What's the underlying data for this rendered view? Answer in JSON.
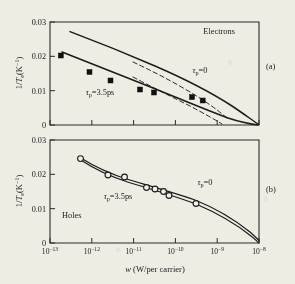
{
  "figure": {
    "background_color": "#efece4",
    "ink_color": "#1a1a1a",
    "xlabel": "w (W/per carrier)",
    "ylabel": "1/Te(K-1)",
    "ylabel_parts": {
      "lead": "1/",
      "t": "T",
      "sub": "e",
      "open": "(K",
      "exp": "−1",
      "close": ")"
    }
  },
  "panel_a": {
    "tag": "(a)",
    "title": "Electrons",
    "annotation_tau0": "τp=0",
    "annotation_tau35": "τp=3.5ps",
    "ytick_labels": [
      "0.03",
      "0.02",
      "0.01",
      "0"
    ]
  },
  "panel_b": {
    "tag": "(b)",
    "title": "Holes",
    "annotation_tau0": "τp=0",
    "annotation_tau35": "τp=3.5ps",
    "ytick_labels": [
      "0.03",
      "0.02",
      "0.01",
      "0"
    ]
  },
  "xaxis": {
    "tick_labels": [
      "10−13",
      "10−12",
      "10−11",
      "10−10",
      "10−9",
      "10−8"
    ],
    "tick_mantissa": "10",
    "tick_exponents": [
      "−13",
      "−12",
      "−11",
      "−10",
      "−9",
      "−8"
    ]
  },
  "chart_data": {
    "type": "line",
    "xlabel": "w (W/per carrier)",
    "ylabel": "1/Te (K^-1)",
    "xscale": "log",
    "xlim": [
      1e-13,
      1e-08
    ],
    "ylim": [
      0,
      0.03
    ],
    "xticks": [
      1e-13,
      1e-12,
      1e-11,
      1e-10,
      1e-09,
      1e-08
    ],
    "yticks": [
      0,
      0.01,
      0.02,
      0.03
    ],
    "grid": false,
    "legend": "inline annotations",
    "panels": [
      {
        "name": "panel_a",
        "tag": "(a)",
        "label": "Electrons",
        "series": [
          {
            "name": "tau_p = 0 (solid, upper)",
            "style": "solid",
            "x": [
              2e-12,
              6e-12,
              2e-11,
              6e-11,
              2e-10,
              6e-10,
              2e-09,
              6e-09,
              1e-08
            ],
            "y": [
              0.0272,
              0.025,
              0.0224,
              0.0202,
              0.0178,
              0.0155,
              0.0125,
              0.007,
              0.002
            ]
          },
          {
            "name": "tau_p = 3.5ps (solid, lower)",
            "style": "solid",
            "x": [
              1e-12,
              4e-12,
              1.5e-11,
              6e-11,
              2e-10,
              6e-10,
              1.5e-09,
              4e-09,
              1e-08
            ],
            "y": [
              0.0212,
              0.0192,
              0.0168,
              0.014,
              0.0118,
              0.0095,
              0.0075,
              0.0048,
              0.0018
            ]
          },
          {
            "name": "tau_p = 0 (dashed)",
            "style": "dashed",
            "x": [
              1.2e-11,
              5e-11,
              2e-10,
              8e-10,
              2.5e-09,
              5e-09
            ],
            "y": [
              0.0205,
              0.0178,
              0.0146,
              0.0112,
              0.0078,
              0.0052
            ]
          },
          {
            "name": "tau_p = 3.5ps (dashed)",
            "style": "dashed",
            "x": [
              1.2e-11,
              5e-11,
              2e-10,
              8e-10,
              2.5e-09,
              5e-09
            ],
            "y": [
              0.0162,
              0.0132,
              0.0104,
              0.0076,
              0.005,
              0.003
            ]
          },
          {
            "name": "experimental data",
            "style": "filled-square",
            "x": [
              1e-12,
              6e-12,
              2e-11,
              1e-10,
              2.2e-10,
              1e-09,
              1.8e-09
            ],
            "y": [
              0.0201,
              0.0153,
              0.0128,
              0.0102,
              0.0093,
              0.008,
              0.007
            ]
          }
        ]
      },
      {
        "name": "panel_b",
        "tag": "(b)",
        "label": "Holes",
        "series": [
          {
            "name": "tau_p = 0 (solid, upper)",
            "style": "solid",
            "x": [
              2.5e-12,
              1e-11,
              5e-11,
              1.5e-10,
              5e-10,
              1.5e-09,
              5e-09,
              1e-08
            ],
            "y": [
              0.0248,
              0.0205,
              0.0178,
              0.0163,
              0.0145,
              0.0125,
              0.008,
              0.0052
            ]
          },
          {
            "name": "tau_p = 3.5ps (solid, lower)",
            "style": "solid",
            "x": [
              2.5e-12,
              1e-11,
              5e-11,
              1.5e-10,
              5e-10,
              1.5e-09,
              5e-09,
              1e-08
            ],
            "y": [
              0.0246,
              0.0199,
              0.0172,
              0.0157,
              0.0138,
              0.0118,
              0.0072,
              0.0045
            ]
          },
          {
            "name": "experimental data",
            "style": "open-circle",
            "x": [
              2.6e-12,
              1.2e-11,
              3e-11,
              1e-10,
              1.6e-10,
              2.6e-10,
              3.5e-10,
              1e-09
            ],
            "y": [
              0.0248,
              0.0199,
              0.0194,
              0.0163,
              0.0159,
              0.0152,
              0.014,
              0.0118
            ]
          }
        ]
      }
    ]
  }
}
